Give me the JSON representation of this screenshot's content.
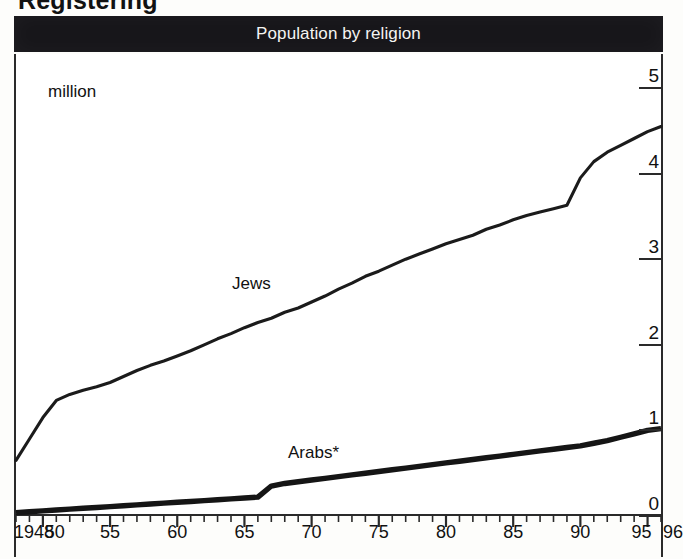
{
  "page": {
    "cropped_heading": "Registering",
    "background_color": "#fdfdfb"
  },
  "titlebar": {
    "title": "Population by religion",
    "background_color": "#17161a",
    "text_color": "#f4f4f2"
  },
  "chart_data": {
    "type": "line",
    "title": "Population by religion",
    "xlabel": "",
    "ylabel": "million",
    "unit_note": "million",
    "xlim": [
      1948,
      1996
    ],
    "ylim": [
      0,
      5
    ],
    "yticks": [
      0,
      1,
      2,
      3,
      4,
      5
    ],
    "ytick_labels": [
      "0",
      "1",
      "2",
      "3",
      "4",
      "5"
    ],
    "y_axis_position": "right",
    "grid": false,
    "xticks": [
      1948,
      1950,
      1955,
      1960,
      1965,
      1970,
      1975,
      1980,
      1985,
      1990,
      1995,
      1996
    ],
    "xtick_labels": [
      "1948",
      "50",
      "55",
      "60",
      "65",
      "70",
      "75",
      "80",
      "85",
      "90",
      "95",
      "96"
    ],
    "minor_tick_interval_years": 1,
    "legend_position": "inline-annotation",
    "annotations": [
      {
        "text": "million",
        "x": 1949,
        "y": 4.95
      },
      {
        "text": "Jews",
        "x": 1966,
        "y": 2.85
      },
      {
        "text": "Arabs*",
        "x": 1971,
        "y": 0.88
      }
    ],
    "footnote_marker": "*",
    "series": [
      {
        "name": "Jews",
        "label": "Jews",
        "color": "#1b1b1b",
        "line_width": 3,
        "x": [
          1948,
          1949,
          1950,
          1951,
          1952,
          1953,
          1954,
          1955,
          1956,
          1957,
          1958,
          1959,
          1960,
          1961,
          1962,
          1963,
          1964,
          1965,
          1966,
          1967,
          1968,
          1969,
          1970,
          1971,
          1972,
          1973,
          1974,
          1975,
          1976,
          1977,
          1978,
          1979,
          1980,
          1981,
          1982,
          1983,
          1984,
          1985,
          1986,
          1987,
          1988,
          1989,
          1990,
          1991,
          1992,
          1993,
          1994,
          1995,
          1996
        ],
        "values": [
          0.65,
          0.9,
          1.15,
          1.35,
          1.42,
          1.47,
          1.51,
          1.56,
          1.63,
          1.7,
          1.76,
          1.81,
          1.87,
          1.93,
          2.0,
          2.07,
          2.13,
          2.2,
          2.26,
          2.31,
          2.38,
          2.43,
          2.5,
          2.57,
          2.65,
          2.72,
          2.8,
          2.86,
          2.93,
          3.0,
          3.06,
          3.12,
          3.18,
          3.23,
          3.28,
          3.35,
          3.4,
          3.46,
          3.51,
          3.55,
          3.59,
          3.63,
          3.95,
          4.14,
          4.25,
          4.33,
          4.41,
          4.49,
          4.55
        ]
      },
      {
        "name": "Arabs*",
        "label": "Arabs*",
        "color": "#151515",
        "line_width": 5,
        "x": [
          1948,
          1949,
          1950,
          1951,
          1952,
          1953,
          1954,
          1955,
          1956,
          1957,
          1958,
          1959,
          1960,
          1961,
          1962,
          1963,
          1964,
          1965,
          1966,
          1967,
          1968,
          1969,
          1970,
          1971,
          1972,
          1973,
          1974,
          1975,
          1976,
          1977,
          1978,
          1979,
          1980,
          1981,
          1982,
          1983,
          1984,
          1985,
          1986,
          1987,
          1988,
          1989,
          1990,
          1991,
          1992,
          1993,
          1994,
          1995,
          1996
        ],
        "values": [
          0.04,
          0.05,
          0.06,
          0.07,
          0.08,
          0.09,
          0.1,
          0.11,
          0.12,
          0.13,
          0.14,
          0.15,
          0.16,
          0.17,
          0.18,
          0.19,
          0.2,
          0.21,
          0.22,
          0.35,
          0.38,
          0.4,
          0.42,
          0.44,
          0.46,
          0.48,
          0.5,
          0.52,
          0.54,
          0.56,
          0.58,
          0.6,
          0.62,
          0.64,
          0.66,
          0.68,
          0.7,
          0.72,
          0.74,
          0.76,
          0.78,
          0.8,
          0.82,
          0.85,
          0.88,
          0.92,
          0.96,
          1.0,
          1.02
        ]
      }
    ]
  }
}
